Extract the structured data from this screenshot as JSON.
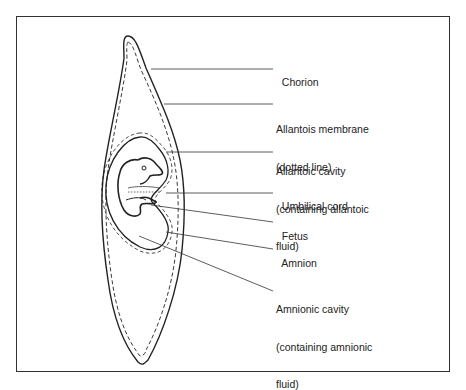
{
  "diagram": {
    "colors": {
      "line": "#222222",
      "frame": "#333333",
      "background": "#ffffff"
    },
    "labels": [
      {
        "id": "chorion",
        "line1": "Chorion",
        "line2": "",
        "line3": ""
      },
      {
        "id": "allantois-membrane",
        "line1": "Allantois membrane",
        "line2": "(dotted line)",
        "line3": ""
      },
      {
        "id": "allantoic-cavity",
        "line1": "Allantoic cavity",
        "line2": "(containing allantoic",
        "line3": "fluid)"
      },
      {
        "id": "umbilical-cord",
        "line1": "Umbilical cord",
        "line2": "",
        "line3": ""
      },
      {
        "id": "fetus",
        "line1": "Fetus",
        "line2": "",
        "line3": ""
      },
      {
        "id": "amnion",
        "line1": "Amnion",
        "line2": "",
        "line3": ""
      },
      {
        "id": "amnionic-cavity",
        "line1": "Amnionic cavity",
        "line2": "(containing amnionic",
        "line3": "fluid)"
      }
    ]
  }
}
